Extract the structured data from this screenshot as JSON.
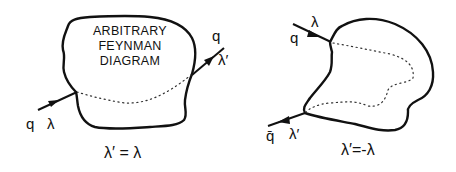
{
  "left_diagram": {
    "box_text": [
      "ARBITRARY",
      "FEYNMAN",
      "DIAGRAM"
    ],
    "incoming": {
      "particle": "q",
      "helicity": "λ"
    },
    "outgoing": {
      "particle": "q",
      "helicity": "λ′"
    },
    "relation": "λ′ = λ"
  },
  "right_diagram": {
    "incoming": {
      "particle": "q",
      "helicity": "λ"
    },
    "outgoing": {
      "particle": "q̄",
      "helicity": "λ′"
    },
    "relation": "λ′=-λ"
  }
}
